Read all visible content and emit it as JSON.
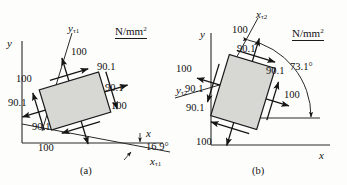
{
  "figure": {
    "units_label": "N/mm",
    "units_exponent": "2",
    "caption_a": "(a)",
    "caption_b": "(b)"
  },
  "panel_a": {
    "id": "panel-a",
    "axis_y": "y",
    "axis_x": "x",
    "rotated_axis_x": "x",
    "rotated_axis_x_sub": "τ1",
    "rotated_axis_y": "y",
    "rotated_axis_y_sub": "τ1",
    "angle": "16.9°",
    "element_rotation_deg": -16.9,
    "stresses": {
      "top_normal": "100",
      "top_shear": "90.1",
      "right_shear": "90.1",
      "right_normal": "100",
      "bottom_normal": "100",
      "bottom_shear": "90.1",
      "left_shear": "90.1",
      "left_normal": "100"
    },
    "labels": [
      {
        "name": "stress-top-100",
        "text": "100"
      },
      {
        "name": "stress-top-right-90",
        "text": "90.1"
      },
      {
        "name": "stress-right-90",
        "text": "90.1"
      },
      {
        "name": "stress-right-100",
        "text": "100"
      },
      {
        "name": "stress-bottom-100",
        "text": "100"
      },
      {
        "name": "stress-bottom-left-90",
        "text": "90.1"
      },
      {
        "name": "stress-left-90",
        "text": "90.1"
      },
      {
        "name": "stress-left-100",
        "text": "100"
      }
    ]
  },
  "panel_b": {
    "id": "panel-b",
    "axis_y": "y",
    "axis_x": "x",
    "rotated_axis_x": "x",
    "rotated_axis_x_sub": "τ2",
    "rotated_axis_y": "y",
    "rotated_axis_y_sub": "τ2",
    "angle": "73.1°",
    "element_rotation_deg": 16.9,
    "stresses": {
      "top_normal": "100",
      "top_shear": "90.1",
      "right_shear": "90.1",
      "right_normal": "100",
      "bottom_normal": "100",
      "bottom_shear": "90.1",
      "left_shear": "90.1",
      "left_normal": "100"
    },
    "labels": [
      {
        "name": "stress-top-100",
        "text": "100"
      },
      {
        "name": "stress-top-90",
        "text": "90.1"
      },
      {
        "name": "stress-right-90",
        "text": "90.1"
      },
      {
        "name": "stress-right-100",
        "text": "100"
      },
      {
        "name": "stress-bottom-100",
        "text": "100"
      },
      {
        "name": "stress-bottom-90",
        "text": "90.1"
      },
      {
        "name": "stress-left-90",
        "text": "90.1"
      },
      {
        "name": "stress-left-100",
        "text": "100"
      }
    ]
  },
  "style": {
    "box_fill": "#d7d7d4",
    "box_stroke": "#1a1a1a",
    "line_color": "#2a2a2a"
  }
}
